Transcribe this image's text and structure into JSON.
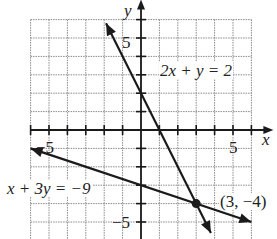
{
  "chart_data": {
    "type": "line",
    "title": "",
    "xlabel": "x",
    "ylabel": "y",
    "xlim": [
      -6,
      6
    ],
    "ylim": [
      -6,
      6
    ],
    "grid": true,
    "tick_labels": {
      "x": [
        "-5",
        "5"
      ],
      "y": [
        "5",
        "-5"
      ]
    },
    "series": [
      {
        "name": "2x + y = 2",
        "equation": "y = 2 - 2x",
        "x": [
          -1.9,
          3.8
        ],
        "y": [
          5.8,
          -5.6
        ]
      },
      {
        "name": "x + 3y = -9",
        "equation": "y = (-9 - x)/3",
        "x": [
          -6,
          6
        ],
        "y": [
          -1,
          -5
        ]
      }
    ],
    "annotations": [
      {
        "text": "2x + y = 2",
        "at": [
          1,
          2.8
        ]
      },
      {
        "text": "x + 3y = −9",
        "at": [
          -6.5,
          -2.3
        ]
      },
      {
        "text": "(3, −4)",
        "at": [
          4,
          -4
        ],
        "point": [
          3,
          -4
        ]
      }
    ]
  },
  "labels": {
    "x_axis": "x",
    "y_axis": "y",
    "x_tick_neg": "−5",
    "x_tick_pos": "5",
    "y_tick_pos": "5",
    "y_tick_neg": "−5",
    "eq1": "2x + y = 2",
    "eq2": "x + 3y = −9",
    "point": "(3, −4)"
  },
  "colors": {
    "ink": "#1a1a1a",
    "grid": "#8a8a8a"
  }
}
